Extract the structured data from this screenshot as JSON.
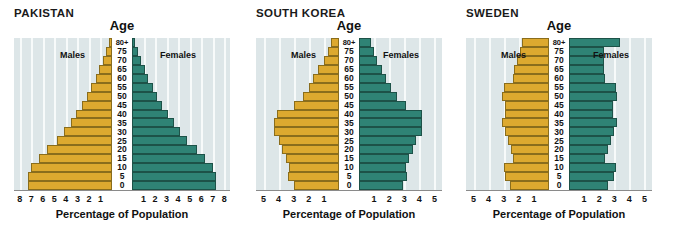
{
  "figure": {
    "axis_title": "Percentage of Population",
    "age_axis_title": "Age",
    "male_label": "Males",
    "female_label": "Females",
    "colors": {
      "male_bar": "#dda92f",
      "male_bar_border": "#8a6d1c",
      "female_bar": "#2f8375",
      "female_bar_border": "#1d5248",
      "plot_background": "#dde6e8",
      "gridline": "#f7fafa",
      "text": "#111111"
    },
    "age_groups": [
      "80+",
      "75",
      "70",
      "65",
      "60",
      "55",
      "50",
      "45",
      "40",
      "35",
      "30",
      "25",
      "20",
      "15",
      "10",
      "5",
      "0"
    ]
  },
  "chart_data": [
    {
      "type": "bar",
      "title": "PAKISTAN",
      "subtype": "population-pyramid",
      "xlabel": "Percentage of Population",
      "ylabel": "Age",
      "categories": [
        "80+",
        "75",
        "70",
        "65",
        "60",
        "55",
        "50",
        "45",
        "40",
        "35",
        "30",
        "25",
        "20",
        "15",
        "10",
        "5",
        "0"
      ],
      "xlim": [
        0,
        8.5
      ],
      "xticks_left": [
        8,
        7,
        6,
        5,
        4,
        3,
        2,
        1
      ],
      "xticks_right": [
        1,
        2,
        3,
        4,
        5,
        6,
        7,
        8
      ],
      "grid": true,
      "legend": [
        "Males",
        "Females"
      ],
      "series": [
        {
          "name": "Males",
          "side": "left",
          "values": [
            0.3,
            0.5,
            0.8,
            1.1,
            1.4,
            1.8,
            2.2,
            2.6,
            3.1,
            3.6,
            4.2,
            4.8,
            5.6,
            6.3,
            7.0,
            7.3,
            7.3
          ]
        },
        {
          "name": "Females",
          "side": "right",
          "values": [
            0.3,
            0.5,
            0.8,
            1.1,
            1.4,
            1.8,
            2.2,
            2.6,
            3.1,
            3.6,
            4.2,
            4.8,
            5.6,
            6.3,
            7.0,
            7.3,
            7.3
          ]
        }
      ]
    },
    {
      "type": "bar",
      "title": "SOUTH KOREA",
      "subtype": "population-pyramid",
      "xlabel": "Percentage of Population",
      "ylabel": "Age",
      "categories": [
        "80+",
        "75",
        "70",
        "65",
        "60",
        "55",
        "50",
        "45",
        "40",
        "35",
        "30",
        "25",
        "20",
        "15",
        "10",
        "5",
        "0"
      ],
      "xlim": [
        0,
        5.5
      ],
      "xticks_left": [
        5,
        4,
        3,
        2,
        1
      ],
      "xticks_right": [
        1,
        2,
        3,
        4,
        5
      ],
      "grid": true,
      "legend": [
        "Males",
        "Females"
      ],
      "series": [
        {
          "name": "Males",
          "side": "left",
          "values": [
            0.5,
            0.7,
            1.0,
            1.4,
            1.7,
            2.0,
            2.4,
            3.0,
            4.1,
            4.3,
            4.3,
            4.0,
            3.8,
            3.5,
            3.3,
            3.4,
            3.0
          ]
        },
        {
          "name": "Females",
          "side": "right",
          "values": [
            0.8,
            1.0,
            1.2,
            1.5,
            1.8,
            2.1,
            2.5,
            3.1,
            4.2,
            4.2,
            4.2,
            3.8,
            3.6,
            3.3,
            3.1,
            3.2,
            2.9
          ]
        }
      ]
    },
    {
      "type": "bar",
      "title": "SWEDEN",
      "subtype": "population-pyramid",
      "xlabel": "Percentage of Population",
      "ylabel": "Age",
      "categories": [
        "80+",
        "75",
        "70",
        "65",
        "60",
        "55",
        "50",
        "45",
        "40",
        "35",
        "30",
        "25",
        "20",
        "15",
        "10",
        "5",
        "0"
      ],
      "xlim": [
        0,
        5.5
      ],
      "xticks_left": [
        5,
        4,
        3,
        2,
        1
      ],
      "xticks_right": [
        1,
        2,
        3,
        4,
        5
      ],
      "grid": true,
      "legend": [
        "Males",
        "Females"
      ],
      "series": [
        {
          "name": "Males",
          "side": "left",
          "values": [
            1.8,
            1.9,
            2.1,
            2.3,
            2.4,
            3.0,
            3.1,
            2.9,
            2.9,
            3.1,
            2.9,
            2.7,
            2.5,
            2.4,
            3.0,
            2.9,
            2.6
          ]
        },
        {
          "name": "Females",
          "side": "right",
          "values": [
            3.4,
            2.3,
            2.3,
            2.3,
            2.4,
            3.1,
            3.2,
            2.9,
            2.9,
            3.2,
            3.0,
            2.8,
            2.6,
            2.4,
            3.1,
            3.0,
            2.6
          ]
        }
      ]
    }
  ],
  "panels": [
    {
      "key": "pakistan",
      "title": "PAKISTAN",
      "max": 8.5,
      "plot_left": 14,
      "plot_top": 38,
      "plot_width": 216,
      "plot_height": 152,
      "label_col_width": 20,
      "male_label_right_offset": 34,
      "female_label_left_offset": 34
    },
    {
      "key": "korea",
      "title": "SOUTH KOREA",
      "max": 5.5,
      "plot_left": 8,
      "plot_top": 38,
      "plot_width": 186,
      "plot_height": 152,
      "label_col_width": 20,
      "male_label_right_offset": 30,
      "female_label_left_offset": 30
    },
    {
      "key": "sweden",
      "title": "SWEDEN",
      "max": 5.5,
      "plot_left": 10,
      "plot_top": 38,
      "plot_width": 186,
      "plot_height": 152,
      "label_col_width": 20,
      "male_label_right_offset": 30,
      "female_label_left_offset": 30
    }
  ]
}
